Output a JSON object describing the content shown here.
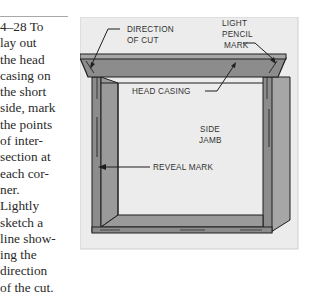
{
  "caption": {
    "figure_number": "4–28",
    "lines": [
      "4–28  To",
      "lay out",
      "the head",
      "casing on",
      "the short",
      "side, mark",
      "the points",
      "of inter-",
      "section at",
      "each cor-",
      "ner.",
      "Lightly",
      "sketch a",
      "line show-",
      "ing the",
      "direction",
      "of the cut."
    ]
  },
  "figure": {
    "labels": {
      "direction_of_cut_1": "DIRECTION",
      "direction_of_cut_2": "OF CUT",
      "light_pencil_mark_1": "LIGHT",
      "light_pencil_mark_2": "PENCIL",
      "light_pencil_mark_3": "MARK",
      "head_casing": "HEAD CASING",
      "side_jamb_1": "SIDE",
      "side_jamb_2": "JAMB",
      "reveal_mark": "REVEAL  MARK"
    },
    "colors": {
      "panel_bg": "#ececec",
      "wood": "#8c8c8c",
      "wood_light": "#a6a6a6",
      "outline": "#1e1e1e"
    }
  }
}
